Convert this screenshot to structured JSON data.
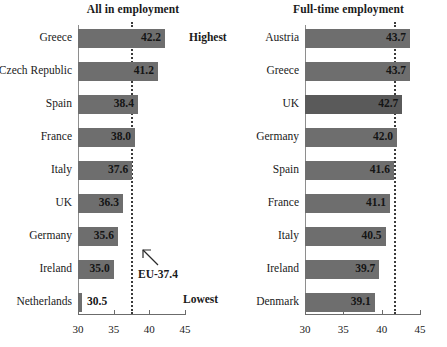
{
  "chart_data": [
    {
      "type": "bar",
      "orientation": "horizontal",
      "title": "All in employment",
      "xlabel": "",
      "ylabel": "",
      "xlim": [
        30,
        45
      ],
      "xticks": [
        30,
        35,
        40,
        45
      ],
      "grid": false,
      "legend": null,
      "categories": [
        "Greece",
        "Czech Republic",
        "Spain",
        "France",
        "Italy",
        "UK",
        "Germany",
        "Ireland",
        "Netherlands"
      ],
      "values": [
        42.2,
        41.2,
        38.4,
        38.0,
        37.6,
        36.3,
        35.6,
        35.0,
        30.5
      ],
      "value_labels": [
        "42.2",
        "41.2",
        "38.4",
        "38.0",
        "37.6",
        "36.3",
        "35.6",
        "35.0",
        "30.5"
      ],
      "reference_line": {
        "value": 41.6,
        "plot_value": 37.4,
        "label": "EU-37.4"
      },
      "annotations": [
        {
          "text": "Highest",
          "position": "top-right"
        },
        {
          "text": "Lowest",
          "position": "bottom-right"
        }
      ]
    },
    {
      "type": "bar",
      "orientation": "horizontal",
      "title": "Full-time employment",
      "xlabel": "",
      "ylabel": "",
      "xlim": [
        30,
        45
      ],
      "xticks": [
        30,
        35,
        40,
        45
      ],
      "grid": false,
      "legend": null,
      "categories": [
        "Austria",
        "Greece",
        "UK",
        "Germany",
        "Spain",
        "France",
        "Italy",
        "Ireland",
        "Denmark"
      ],
      "values": [
        43.7,
        43.7,
        42.7,
        42.0,
        41.6,
        41.1,
        40.5,
        39.7,
        39.1
      ],
      "value_labels": [
        "43.7",
        "43.7",
        "42.7",
        "42.0",
        "41.6",
        "41.1",
        "40.5",
        "39.7",
        "39.1"
      ],
      "reference_line": {
        "value": 41.6,
        "plot_value": 41.6,
        "label": "EU-41.6"
      },
      "annotations": []
    }
  ],
  "left": {
    "title": "All in employment",
    "ticks": [
      "30",
      "35",
      "40",
      "45"
    ],
    "rows": [
      {
        "label": "Greece",
        "value": "42.2"
      },
      {
        "label": "Czech Republic",
        "value": "41.2"
      },
      {
        "label": "Spain",
        "value": "38.4"
      },
      {
        "label": "France",
        "value": "38.0"
      },
      {
        "label": "Italy",
        "value": "37.6"
      },
      {
        "label": "UK",
        "value": "36.3"
      },
      {
        "label": "Germany",
        "value": "35.6"
      },
      {
        "label": "Ireland",
        "value": "35.0"
      },
      {
        "label": "Netherlands",
        "value": "30.5"
      }
    ],
    "eu_label": "EU-37.4",
    "rank_highest": "Highest",
    "rank_lowest": "Lowest"
  },
  "right": {
    "title": "Full-time employment",
    "ticks": [
      "30",
      "35",
      "40",
      "45"
    ],
    "rows": [
      {
        "label": "Austria",
        "value": "43.7"
      },
      {
        "label": "Greece",
        "value": "43.7"
      },
      {
        "label": "UK",
        "value": "42.7"
      },
      {
        "label": "Germany",
        "value": "42.0"
      },
      {
        "label": "Spain",
        "value": "41.6"
      },
      {
        "label": "France",
        "value": "41.1"
      },
      {
        "label": "Italy",
        "value": "40.5"
      },
      {
        "label": "Ireland",
        "value": "39.7"
      },
      {
        "label": "Denmark",
        "value": "39.1"
      }
    ],
    "eu_label": "EU-41.6"
  },
  "colors": {
    "bar": "#6e6e6e",
    "bar_highlight": "#5a5a5a",
    "reference_line": "#3a3a3a",
    "axis": "#6b6b6b",
    "text": "#1a1a1a"
  }
}
